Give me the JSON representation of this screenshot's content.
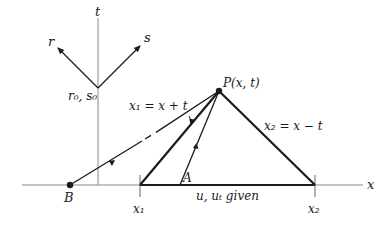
{
  "diagram": {
    "axes": {
      "t_label": "t",
      "x_label": "x"
    },
    "characteristic_axes": {
      "r_label": "r",
      "s_label": "s",
      "origin_label": "r₀, s₀"
    },
    "point_P": {
      "label": "P(x, t)"
    },
    "point_A": {
      "label": "A"
    },
    "point_B": {
      "label": "B"
    },
    "line_x1": {
      "label": "x₁ = x + t"
    },
    "line_x2": {
      "label": "x₂ = x − t"
    },
    "base_label": "u, uₜ given",
    "tick_x1": "x₁",
    "tick_x2": "x₂",
    "colors": {
      "line": "#1a1a1a",
      "axis": "#888888"
    }
  }
}
